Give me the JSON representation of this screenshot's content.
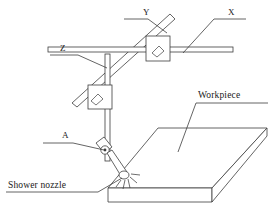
{
  "figure": {
    "type": "technical-line-diagram",
    "stroke_color": "#3d3d3d",
    "text_color": "#1a1a1a",
    "background_color": "#ffffff"
  },
  "labels": {
    "axis_y": "Y",
    "axis_x": "X",
    "axis_z": "Z",
    "axis_a": "A",
    "workpiece": "Workpiece",
    "shower_nozzle": "Shower nozzle"
  },
  "parts": [
    {
      "name": "x-rail",
      "label": "X",
      "kind": "horizontal-linear-rail"
    },
    {
      "name": "y-rail",
      "label": "Y",
      "kind": "diagonal-linear-rail"
    },
    {
      "name": "z-column",
      "label": "Z",
      "kind": "vertical-linear-rail"
    },
    {
      "name": "a-joint",
      "label": "A",
      "kind": "rotary-pivot"
    },
    {
      "name": "upper-carriage",
      "label": "",
      "kind": "carriage-block"
    },
    {
      "name": "lower-carriage",
      "label": "",
      "kind": "carriage-block"
    },
    {
      "name": "nozzle",
      "label": "Shower nozzle",
      "kind": "spray-nozzle"
    },
    {
      "name": "workpiece",
      "label": "Workpiece",
      "kind": "plate"
    }
  ]
}
